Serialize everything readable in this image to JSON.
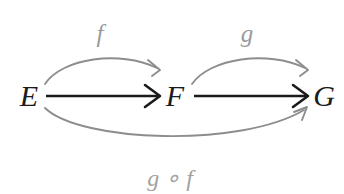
{
  "diagram": {
    "kind": "commutative-diagram",
    "background_color": "#ffffff",
    "objects": [
      {
        "id": "E",
        "label": "E",
        "x": 29,
        "y": 106
      },
      {
        "id": "F",
        "label": "F",
        "x": 175,
        "y": 106
      },
      {
        "id": "G",
        "label": "G",
        "x": 324,
        "y": 106
      }
    ],
    "morphisms": [
      {
        "id": "f-curve",
        "label": "f",
        "from": "E",
        "to": "F",
        "style": "curved-above",
        "color": "#8d8d8d",
        "label_x": 100,
        "label_y": 42
      },
      {
        "id": "g-curve",
        "label": "g",
        "from": "F",
        "to": "G",
        "style": "curved-above",
        "color": "#8d8d8d",
        "label_x": 247,
        "label_y": 42
      },
      {
        "id": "g-compose-f",
        "label": "g ∘ f",
        "from": "E",
        "to": "G",
        "style": "curved-below",
        "color": "#8d8d8d",
        "label_x": 170,
        "label_y": 186
      },
      {
        "id": "e-to-f-straight",
        "label": "",
        "from": "E",
        "to": "F",
        "style": "straight",
        "color": "#1a1a1a"
      },
      {
        "id": "f-to-g-straight",
        "label": "",
        "from": "F",
        "to": "G",
        "style": "straight",
        "color": "#1a1a1a"
      }
    ],
    "colors": {
      "object_text": "#1b1b1b",
      "solid_arrow": "#1a1a1a",
      "curved_arrow": "#8d8d8d",
      "morphism_text": "#9a9a9a"
    }
  }
}
